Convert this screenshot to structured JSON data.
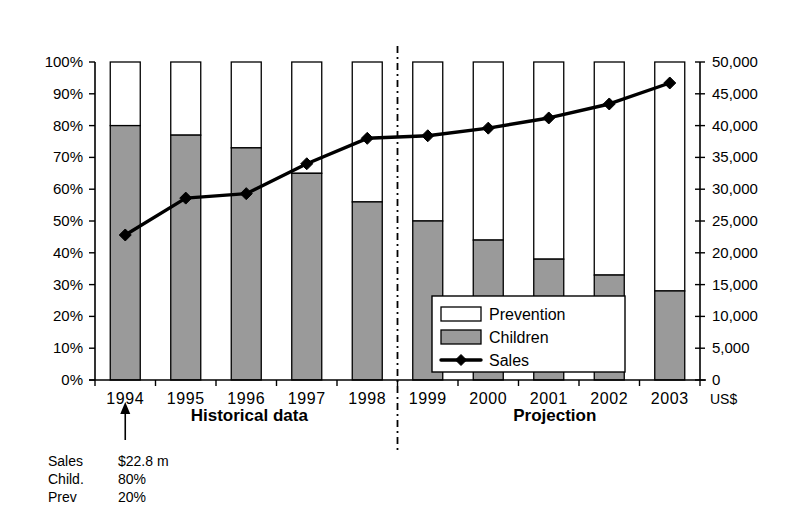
{
  "chart_data": {
    "type": "bar",
    "title": "",
    "subtitle": "",
    "xlabel": "",
    "ylabel": "",
    "grid": false,
    "legend_position": "inside-bottom-center",
    "categories": [
      "1994",
      "1995",
      "1996",
      "1997",
      "1998",
      "1999",
      "2000",
      "2001",
      "2002",
      "2003"
    ],
    "left_axis": {
      "label": "",
      "ylim": [
        0,
        100
      ],
      "tick_step": 10,
      "unit": "%",
      "tick_labels": [
        "0%",
        "10%",
        "20%",
        "30%",
        "40%",
        "50%",
        "60%",
        "70%",
        "80%",
        "90%",
        "100%"
      ],
      "tick_values": [
        0,
        10,
        20,
        30,
        40,
        50,
        60,
        70,
        80,
        90,
        100
      ]
    },
    "right_axis": {
      "label": "US$",
      "ylim": [
        0,
        50000
      ],
      "tick_step": 5000,
      "tick_labels": [
        "0",
        "5,000",
        "10,000",
        "15,000",
        "20,000",
        "25,000",
        "30,000",
        "35,000",
        "40,000",
        "45,000",
        "50,000"
      ],
      "tick_values": [
        0,
        5000,
        10000,
        15000,
        20000,
        25000,
        30000,
        35000,
        40000,
        45000,
        50000
      ]
    },
    "series": [
      {
        "name": "Children",
        "axis": "left",
        "kind": "stacked-bar-bottom",
        "unit": "%",
        "color": "#9a9a9a",
        "values": [
          80,
          77,
          73,
          65,
          56,
          50,
          44,
          38,
          33,
          28
        ]
      },
      {
        "name": "Prevention",
        "axis": "left",
        "kind": "stacked-bar-top",
        "unit": "%",
        "color": "#ffffff",
        "values": [
          20,
          23,
          27,
          35,
          44,
          50,
          56,
          62,
          67,
          72
        ]
      },
      {
        "name": "Sales",
        "axis": "right",
        "kind": "line-marker",
        "unit": "US$",
        "color": "#000000",
        "values": [
          22800,
          28600,
          29300,
          34000,
          38000,
          38400,
          39600,
          41200,
          43400,
          46700
        ]
      }
    ],
    "annotations": [
      {
        "id": "historical",
        "text": "Historical data",
        "target": "1994-1998",
        "style": "bold"
      },
      {
        "id": "projection",
        "text": "Projection",
        "target": "1999-2003",
        "style": "bold"
      },
      {
        "id": "divider",
        "text": "",
        "target": "between 1998 and 1999",
        "style": "dash-dot-vertical"
      },
      {
        "id": "callout-arrow",
        "text": "",
        "target": "1994",
        "style": "up-arrow"
      }
    ],
    "callout": {
      "target_year": "1994",
      "rows": [
        {
          "label": "Sales",
          "value": "$22.8 m"
        },
        {
          "label": "Child.",
          "value": "80%"
        },
        {
          "label": "Prev",
          "value": "20%"
        }
      ]
    },
    "legend": {
      "entries": [
        {
          "label": "Prevention",
          "marker": "box-white"
        },
        {
          "label": "Children",
          "marker": "box-gray"
        },
        {
          "label": "Sales",
          "marker": "line-diamond"
        }
      ]
    }
  }
}
